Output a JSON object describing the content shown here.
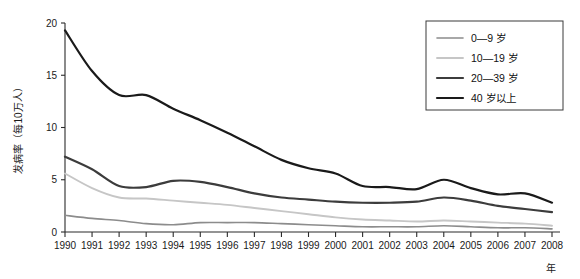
{
  "chart_data": {
    "type": "line",
    "title": "",
    "subtitle": "",
    "xlabel": "年",
    "ylabel": "发病率（每10万人）",
    "xlim": [
      1990,
      2008
    ],
    "ylim": [
      0,
      20
    ],
    "grid": false,
    "legend_position": "top-right",
    "x": [
      1990,
      1991,
      1992,
      1993,
      1994,
      1995,
      1996,
      1997,
      1998,
      1999,
      2000,
      2001,
      2002,
      2003,
      2004,
      2005,
      2006,
      2007,
      2008
    ],
    "xticklabels": [
      "1990",
      "1991",
      "1992",
      "1993",
      "1994",
      "1995",
      "1996",
      "1997",
      "1998",
      "1999",
      "2000",
      "2001",
      "2002",
      "2003",
      "2004",
      "2005",
      "2006",
      "2007",
      "2008"
    ],
    "yticklabels": [
      "0",
      "5",
      "10",
      "15",
      "20"
    ],
    "yticks": [
      0,
      5,
      10,
      15,
      20
    ],
    "series": [
      {
        "name": "0—9 岁",
        "color": "#8c8c8c",
        "width": 1.6,
        "values": [
          1.6,
          1.3,
          1.1,
          0.8,
          0.7,
          0.9,
          0.9,
          0.9,
          0.8,
          0.7,
          0.6,
          0.5,
          0.5,
          0.5,
          0.6,
          0.5,
          0.4,
          0.4,
          0.3
        ]
      },
      {
        "name": "10—19 岁",
        "color": "#c6c6c6",
        "width": 1.9,
        "values": [
          5.6,
          4.2,
          3.3,
          3.2,
          3.0,
          2.8,
          2.6,
          2.3,
          2.0,
          1.7,
          1.4,
          1.2,
          1.1,
          1.0,
          1.1,
          1.0,
          0.9,
          0.8,
          0.6
        ]
      },
      {
        "name": "20—39 岁",
        "color": "#3c3c3c",
        "width": 2.2,
        "values": [
          7.2,
          6.0,
          4.4,
          4.3,
          4.9,
          4.8,
          4.3,
          3.7,
          3.3,
          3.1,
          2.9,
          2.8,
          2.8,
          2.9,
          3.3,
          3.0,
          2.5,
          2.2,
          1.9
        ]
      },
      {
        "name": "40 岁以上",
        "color": "#1a1a1a",
        "width": 2.2,
        "values": [
          19.3,
          15.4,
          13.1,
          13.1,
          11.8,
          10.7,
          9.5,
          8.2,
          6.9,
          6.1,
          5.6,
          4.4,
          4.3,
          4.1,
          5.0,
          4.2,
          3.6,
          3.7,
          2.8
        ]
      }
    ]
  },
  "axes": {
    "y_axis_title": "发病率（每10万人）",
    "x_axis_title": "年"
  },
  "legend": {
    "items": [
      {
        "label": "0—9 岁",
        "color": "#8c8c8c"
      },
      {
        "label": "10—19 岁",
        "color": "#c6c6c6"
      },
      {
        "label": "20—39 岁",
        "color": "#3c3c3c"
      },
      {
        "label": "40 岁以上",
        "color": "#1a1a1a"
      }
    ]
  }
}
